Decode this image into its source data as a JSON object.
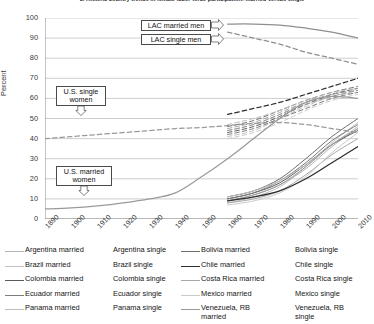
{
  "chart_data": {
    "type": "line",
    "title": "3. Historic country trends in female labor force participation: married versus single",
    "xlabel": "",
    "ylabel": "Percent",
    "xlim": [
      1890,
      2010
    ],
    "ylim": [
      0,
      100
    ],
    "ytick_step": 10,
    "grid": "horizontal",
    "legend_position": "below",
    "yticks": [
      "100",
      "90",
      "80",
      "70",
      "60",
      "50",
      "40",
      "30",
      "20",
      "10",
      "0"
    ],
    "xticks": [
      "1890",
      "1900",
      "1910",
      "1920",
      "1930",
      "1940",
      "1950",
      "1960",
      "1970",
      "1980",
      "1990",
      "2000",
      "2010"
    ],
    "annotations": [
      {
        "name": "lac-married-men",
        "label": "LAC married men",
        "arrow": "right"
      },
      {
        "name": "lac-single-men",
        "label": "LAC single men",
        "arrow": "right"
      },
      {
        "name": "us-single-women",
        "label": "U.S. single women",
        "arrow": "down"
      },
      {
        "name": "us-married-women",
        "label": "U.S. married women",
        "arrow": "down"
      }
    ],
    "series": [
      {
        "name": "LAC married men",
        "style": "solid",
        "color": "#8f8f8f",
        "x": [
          1960,
          1970,
          1980,
          1990,
          2000,
          2010
        ],
        "values": [
          97,
          97,
          96.5,
          95,
          93,
          90
        ]
      },
      {
        "name": "LAC single men",
        "style": "dashed",
        "color": "#8f8f8f",
        "x": [
          1960,
          1970,
          1980,
          1990,
          2000,
          2010
        ],
        "values": [
          93,
          90,
          87,
          83,
          80,
          77
        ]
      },
      {
        "name": "U.S. single women",
        "style": "dashed",
        "color": "#9a9a9a",
        "x": [
          1890,
          1900,
          1910,
          1920,
          1930,
          1940,
          1950,
          1960,
          1970,
          1980,
          1990,
          2000,
          2010
        ],
        "values": [
          40,
          41,
          42,
          43,
          44,
          45,
          45.5,
          46.5,
          47.5,
          48,
          47,
          45,
          43
        ]
      },
      {
        "name": "U.S. married women",
        "style": "solid",
        "color": "#9a9a9a",
        "x": [
          1890,
          1900,
          1910,
          1920,
          1930,
          1940,
          1950,
          1960,
          1970,
          1980,
          1990,
          2000,
          2010
        ],
        "values": [
          5,
          5.5,
          6.5,
          8,
          10,
          13,
          21,
          30,
          40,
          50,
          58,
          61,
          60
        ]
      },
      {
        "name": "Argentina married",
        "style": "solid",
        "color": "#b4b4b4",
        "x": [
          1960,
          1970,
          1980,
          1990,
          2000,
          2010
        ],
        "values": [
          9,
          12,
          17,
          25,
          36,
          45
        ]
      },
      {
        "name": "Argentina single",
        "style": "dashed",
        "color": "#b4b4b4",
        "x": [
          1960,
          1970,
          1980,
          1990,
          2000,
          2010
        ],
        "values": [
          44,
          47,
          52,
          58,
          62,
          64
        ]
      },
      {
        "name": "Brazil married",
        "style": "solid",
        "color": "#c0c0c0",
        "x": [
          1960,
          1970,
          1980,
          1990,
          2000,
          2010
        ],
        "values": [
          8,
          11,
          16,
          26,
          38,
          48
        ]
      },
      {
        "name": "Brazil single",
        "style": "dashed",
        "color": "#c0c0c0",
        "x": [
          1960,
          1970,
          1980,
          1990,
          2000,
          2010
        ],
        "values": [
          41,
          44,
          50,
          56,
          61,
          63
        ]
      },
      {
        "name": "Bolivia married",
        "style": "solid",
        "color": "#6e6e6e",
        "x": [
          1960,
          1970,
          1980,
          1990,
          2000,
          2010
        ],
        "values": [
          11,
          14,
          20,
          30,
          41,
          50
        ]
      },
      {
        "name": "Bolivia single",
        "style": "dashed",
        "color": "#6e6e6e",
        "x": [
          1960,
          1970,
          1980,
          1990,
          2000,
          2010
        ],
        "values": [
          46,
          49,
          54,
          59,
          63,
          66
        ]
      },
      {
        "name": "Colombia married",
        "style": "solid",
        "color": "#5a5a5a",
        "x": [
          1960,
          1970,
          1980,
          1990,
          2000,
          2010
        ],
        "values": [
          10,
          13,
          18,
          27,
          37,
          44
        ]
      },
      {
        "name": "Colombia single",
        "style": "dashed",
        "color": "#5a5a5a",
        "x": [
          1960,
          1970,
          1980,
          1990,
          2000,
          2010
        ],
        "values": [
          43,
          46,
          51,
          57,
          62,
          65
        ]
      },
      {
        "name": "Chile married",
        "style": "solid",
        "color": "#2e2e2e",
        "x": [
          1960,
          1970,
          1980,
          1990,
          2000,
          2010
        ],
        "values": [
          9,
          11,
          14,
          20,
          28,
          36
        ]
      },
      {
        "name": "Chile single",
        "style": "dashed",
        "color": "#2e2e2e",
        "x": [
          1960,
          1970,
          1980,
          1990,
          2000,
          2010
        ],
        "values": [
          52,
          55,
          58,
          62,
          66,
          70
        ]
      },
      {
        "name": "Ecuador married",
        "style": "solid",
        "color": "#7c7c7c",
        "x": [
          1960,
          1970,
          1980,
          1990,
          2000,
          2010
        ],
        "values": [
          10,
          13,
          19,
          28,
          39,
          47
        ]
      },
      {
        "name": "Ecuador single",
        "style": "dashed",
        "color": "#7c7c7c",
        "x": [
          1960,
          1970,
          1980,
          1990,
          2000,
          2010
        ],
        "values": [
          42,
          45,
          50,
          55,
          60,
          63
        ]
      },
      {
        "name": "Costa Rica married",
        "style": "solid",
        "color": "#a8a8a8",
        "x": [
          1960,
          1970,
          1980,
          1990,
          2000,
          2010
        ],
        "values": [
          8,
          10,
          14,
          22,
          32,
          40
        ]
      },
      {
        "name": "Costa Rica single",
        "style": "dashed",
        "color": "#a8a8a8",
        "x": [
          1960,
          1970,
          1980,
          1990,
          2000,
          2010
        ],
        "values": [
          45,
          48,
          53,
          58,
          62,
          64
        ]
      },
      {
        "name": "Mexico married",
        "style": "solid",
        "color": "#cacaca",
        "x": [
          1960,
          1970,
          1980,
          1990,
          2000,
          2010
        ],
        "values": [
          7,
          9,
          13,
          21,
          33,
          43
        ]
      },
      {
        "name": "Mexico single",
        "style": "dashed",
        "color": "#cacaca",
        "x": [
          1960,
          1970,
          1980,
          1990,
          2000,
          2010
        ],
        "values": [
          40,
          43,
          48,
          54,
          59,
          62
        ]
      },
      {
        "name": "Panama married",
        "style": "solid",
        "color": "#bdbdbd",
        "x": [
          1960,
          1970,
          1980,
          1990,
          2000,
          2010
        ],
        "values": [
          11,
          14,
          19,
          27,
          37,
          46
        ]
      },
      {
        "name": "Panama single",
        "style": "dashed",
        "color": "#bdbdbd",
        "x": [
          1960,
          1970,
          1980,
          1990,
          2000,
          2010
        ],
        "values": [
          47,
          50,
          54,
          59,
          63,
          65
        ]
      },
      {
        "name": "Venezuela, RB married",
        "style": "solid",
        "color": "#989898",
        "x": [
          1960,
          1970,
          1980,
          1990,
          2000,
          2010
        ],
        "values": [
          9,
          12,
          17,
          26,
          37,
          45
        ]
      },
      {
        "name": "Venezuela, RB single",
        "style": "dashed",
        "color": "#989898",
        "x": [
          1960,
          1970,
          1980,
          1990,
          2000,
          2010
        ],
        "values": [
          44,
          47,
          52,
          57,
          61,
          64
        ]
      }
    ]
  },
  "legend": {
    "items": [
      {
        "label": "Argentina married",
        "style": "solid",
        "color": "#b4b4b4"
      },
      {
        "label": "Argentina single",
        "style": "dashed",
        "color": "#b4b4b4"
      },
      {
        "label": "Bolivia married",
        "style": "solid",
        "color": "#6e6e6e"
      },
      {
        "label": "Bolivia single",
        "style": "dashed",
        "color": "#6e6e6e"
      },
      {
        "label": "Brazil married",
        "style": "solid",
        "color": "#c0c0c0"
      },
      {
        "label": "Brazil single",
        "style": "dashed",
        "color": "#c0c0c0"
      },
      {
        "label": "Chile married",
        "style": "solid",
        "color": "#2e2e2e"
      },
      {
        "label": "Chile single",
        "style": "dashed",
        "color": "#2e2e2e"
      },
      {
        "label": "Colombia married",
        "style": "solid",
        "color": "#5a5a5a"
      },
      {
        "label": "Colombia single",
        "style": "dashed",
        "color": "#5a5a5a"
      },
      {
        "label": "Costa Rica married",
        "style": "solid",
        "color": "#a8a8a8"
      },
      {
        "label": "Costa Rica single",
        "style": "dashed",
        "color": "#a8a8a8"
      },
      {
        "label": "Ecuador married",
        "style": "solid",
        "color": "#7c7c7c"
      },
      {
        "label": "Ecuador single",
        "style": "dashed",
        "color": "#7c7c7c"
      },
      {
        "label": "Mexico married",
        "style": "solid",
        "color": "#cacaca"
      },
      {
        "label": "Mexico single",
        "style": "dashed",
        "color": "#cacaca"
      },
      {
        "label": "Panama married",
        "style": "solid",
        "color": "#bdbdbd"
      },
      {
        "label": "Panama single",
        "style": "dashed",
        "color": "#bdbdbd"
      },
      {
        "label": "Venezuela, RB married",
        "style": "solid",
        "color": "#989898"
      },
      {
        "label": "Venezuela, RB single",
        "style": "dashed",
        "color": "#989898"
      }
    ]
  },
  "colors": {
    "axis": "#8a8a8a",
    "grid": "#b9b9b9",
    "text": "#1a1a1a"
  }
}
